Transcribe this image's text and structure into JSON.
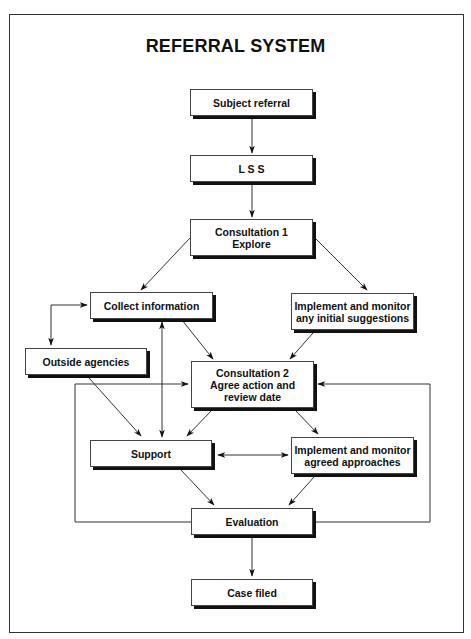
{
  "diagram": {
    "title": "REFERRAL SYSTEM",
    "nodes": {
      "subject_referral": "Subject referral",
      "lss": "L S S",
      "consultation1": "Consultation 1\nExplore",
      "collect_information": "Collect information",
      "implement_initial": "Implement and monitor\nany initial suggestions",
      "outside_agencies": "Outside agencies",
      "consultation2": "Consultation 2\nAgree action and\nreview date",
      "support": "Support",
      "implement_agreed": "Implement and monitor\nagreed approaches",
      "evaluation": "Evaluation",
      "case_filed": "Case filed"
    },
    "edges": [
      {
        "from": "subject_referral",
        "to": "lss",
        "type": "arrow"
      },
      {
        "from": "lss",
        "to": "consultation1",
        "type": "arrow"
      },
      {
        "from": "consultation1",
        "to": "collect_information",
        "type": "arrow"
      },
      {
        "from": "consultation1",
        "to": "implement_initial",
        "type": "arrow"
      },
      {
        "from": "collect_information",
        "to": "outside_agencies",
        "type": "bidirectional"
      },
      {
        "from": "collect_information",
        "to": "consultation2",
        "type": "arrow"
      },
      {
        "from": "implement_initial",
        "to": "consultation2",
        "type": "arrow"
      },
      {
        "from": "collect_information",
        "to": "support",
        "type": "bidirectional"
      },
      {
        "from": "outside_agencies",
        "to": "support",
        "type": "arrow"
      },
      {
        "from": "consultation2",
        "to": "support",
        "type": "arrow"
      },
      {
        "from": "consultation2",
        "to": "implement_agreed",
        "type": "arrow"
      },
      {
        "from": "support",
        "to": "implement_agreed",
        "type": "bidirectional"
      },
      {
        "from": "support",
        "to": "evaluation",
        "type": "arrow"
      },
      {
        "from": "implement_agreed",
        "to": "evaluation",
        "type": "arrow"
      },
      {
        "from": "evaluation",
        "to": "consultation2",
        "type": "feedback-left"
      },
      {
        "from": "evaluation",
        "to": "consultation2",
        "type": "feedback-right"
      },
      {
        "from": "evaluation",
        "to": "case_filed",
        "type": "arrow"
      }
    ]
  }
}
